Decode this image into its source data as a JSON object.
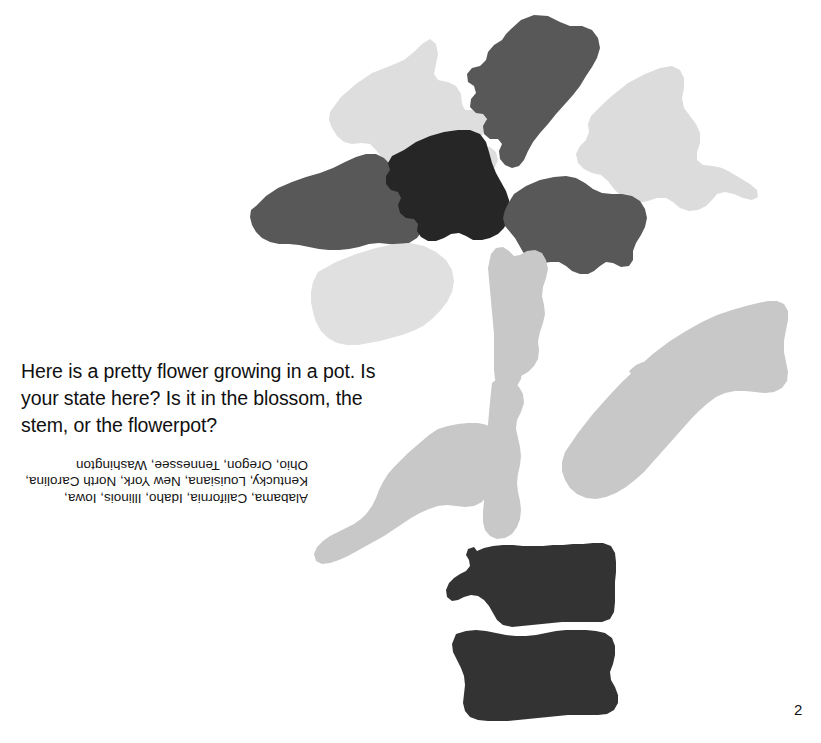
{
  "page": {
    "number": "2",
    "background_color": "#ffffff"
  },
  "prompt": {
    "text": "Here is a pretty flower growing in a pot. Is your state here? Is it in the blossom, the stem, or the flowerpot?"
  },
  "answer_key": {
    "text": "Alabama, California, Idaho, Illinois, Iowa, Kentucky, Louisiana, New York, North Carolina, Ohio, Oregon, Tennessee, Washington",
    "orientation": "upside-down"
  },
  "palette": {
    "very_dark": "#262626",
    "dark": "#333333",
    "medium_dark": "#585858",
    "medium": "#c4c4c4",
    "light": "#d4d4d4",
    "very_light": "#e0e0e0",
    "white": "#ffffff"
  },
  "illustration": {
    "title": "Flower made of US state outlines",
    "parts": [
      {
        "group": "blossom",
        "shapes": [
          {
            "name": "louisiana",
            "label": "Louisiana",
            "fill": "#dedede",
            "role": "petal-upper-left"
          },
          {
            "name": "kentucky",
            "label": "Kentucky",
            "fill": "#585858",
            "role": "petal-top"
          },
          {
            "name": "new-york",
            "label": "New York",
            "fill": "#dcdcdc",
            "role": "petal-upper-right"
          },
          {
            "name": "iowa",
            "label": "Iowa",
            "fill": "#585858",
            "role": "petal-left"
          },
          {
            "name": "ohio",
            "label": "Ohio",
            "fill": "#262626",
            "role": "blossom-center"
          },
          {
            "name": "north-carolina",
            "label": "North Carolina",
            "fill": "#585858",
            "role": "petal-right"
          },
          {
            "name": "tennessee",
            "label": "Tennessee",
            "fill": "#e0e0e0",
            "role": "petal-lower-left"
          }
        ]
      },
      {
        "group": "stem",
        "shapes": [
          {
            "name": "illinois-upper",
            "label": "Illinois",
            "fill": "#c8c8c8",
            "role": "stem-upper"
          },
          {
            "name": "illinois-lower",
            "label": "Illinois",
            "fill": "#c8c8c8",
            "role": "stem-lower"
          },
          {
            "name": "california-leaf",
            "label": "California",
            "fill": "#c8c8c8",
            "role": "leaf-right"
          },
          {
            "name": "idaho-leaf",
            "label": "Idaho",
            "fill": "#c8c8c8",
            "role": "leaf-left"
          },
          {
            "name": "alabama-sliver",
            "label": "Alabama",
            "fill": "#c8c8c8",
            "role": "stem-sliver"
          }
        ]
      },
      {
        "group": "flowerpot",
        "shapes": [
          {
            "name": "washington",
            "label": "Washington",
            "fill": "#333333",
            "role": "pot-rim"
          },
          {
            "name": "oregon",
            "label": "Oregon",
            "fill": "#333333",
            "role": "pot-body"
          }
        ]
      }
    ]
  }
}
